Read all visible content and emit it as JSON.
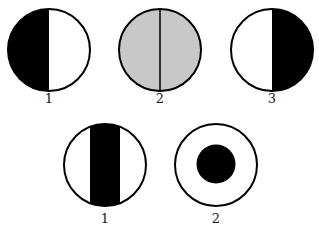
{
  "figure": {
    "colors": {
      "background": "#ffffff",
      "ink": "#000000",
      "gray_fill": "#c8c8c8"
    },
    "top_row": [
      {
        "label": "1",
        "description": "left half black, right half white"
      },
      {
        "label": "2",
        "description": "uniform gray disc with central vertical line"
      },
      {
        "label": "3",
        "description": "left half white, right half black"
      }
    ],
    "bottom_row": [
      {
        "label": "1",
        "description": "white disc with central vertical black band"
      },
      {
        "label": "2",
        "description": "white disc with central black dot"
      }
    ]
  }
}
